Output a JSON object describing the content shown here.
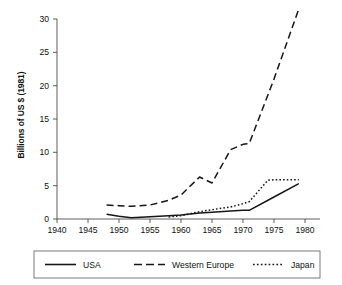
{
  "chart_data": {
    "type": "line",
    "title": "",
    "xlabel": "",
    "ylabel": "Billions of US $ (1981)",
    "xlim": [
      1940,
      1980
    ],
    "ylim": [
      0,
      31.5
    ],
    "xticks": [
      "1940",
      "1945",
      "1950",
      "1955",
      "1960",
      "1965",
      "1970",
      "1975",
      "1980"
    ],
    "yticks": [
      "0",
      "5",
      "10",
      "15",
      "20",
      "25",
      "30"
    ],
    "grid": false,
    "legend_position": "bottom",
    "series": [
      {
        "name": "USA",
        "style": "solid",
        "x": [
          1948,
          1950,
          1952,
          1955,
          1958,
          1960,
          1963,
          1965,
          1968,
          1970,
          1971,
          1975,
          1979
        ],
        "values": [
          0.7,
          0.4,
          0.2,
          0.35,
          0.5,
          0.6,
          0.9,
          1.0,
          1.2,
          1.3,
          1.3,
          3.3,
          5.3
        ]
      },
      {
        "name": "Western Europe",
        "style": "long-dash",
        "x": [
          1948,
          1950,
          1952,
          1955,
          1958,
          1960,
          1963,
          1965,
          1968,
          1970,
          1971,
          1975,
          1979
        ],
        "values": [
          2.1,
          2.0,
          1.9,
          2.1,
          2.8,
          3.6,
          6.3,
          5.4,
          10.4,
          11.2,
          11.3,
          21.0,
          31.5
        ]
      },
      {
        "name": "Japan",
        "style": "dotted",
        "x": [
          1958,
          1960,
          1963,
          1965,
          1968,
          1970,
          1971,
          1974,
          1975,
          1979
        ],
        "values": [
          0.3,
          0.5,
          1.1,
          1.4,
          1.8,
          2.3,
          2.6,
          5.8,
          5.9,
          5.9
        ]
      }
    ]
  },
  "legend": {
    "items": [
      {
        "label": "USA",
        "style": "solid"
      },
      {
        "label": "Western Europe",
        "style": "long-dash"
      },
      {
        "label": "Japan",
        "style": "dotted"
      }
    ]
  },
  "colors": {
    "line": "#161616",
    "axis": "#4a4a4a",
    "legend_border": "#6b6b6b",
    "background": "#ffffff"
  }
}
